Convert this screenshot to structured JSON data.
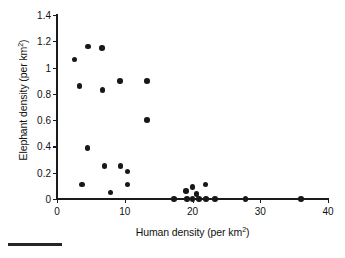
{
  "chart_data": {
    "type": "scatter",
    "title": "",
    "xlabel": "Human density (per km",
    "xlabel_sup": "2",
    "xlabel_tail": ")",
    "ylabel": "Elephant density (per km",
    "ylabel_sup": "2",
    "ylabel_tail": ")",
    "xlim": [
      0,
      40
    ],
    "ylim": [
      0,
      1.4
    ],
    "grid": false,
    "legend": "none",
    "marker": "filled-circle",
    "marker_color": "#181818",
    "xticks": [
      0,
      10,
      20,
      30,
      40
    ],
    "xtick_labels": [
      "0",
      "10",
      "20",
      "30",
      "40"
    ],
    "yticks": [
      0,
      0.2,
      0.4,
      0.6,
      0.8,
      1,
      1.2,
      1.4
    ],
    "ytick_labels": [
      "0",
      "0.2",
      "0.4",
      "0.6",
      "0.8",
      "1",
      "1.2",
      "1.4"
    ],
    "points": [
      {
        "x": 2.6,
        "y": 1.06
      },
      {
        "x": 3.3,
        "y": 0.86
      },
      {
        "x": 4.6,
        "y": 1.16
      },
      {
        "x": 6.6,
        "y": 1.15
      },
      {
        "x": 6.7,
        "y": 0.83
      },
      {
        "x": 9.3,
        "y": 0.9
      },
      {
        "x": 13.3,
        "y": 0.9
      },
      {
        "x": 13.3,
        "y": 0.6
      },
      {
        "x": 4.5,
        "y": 0.39
      },
      {
        "x": 7.0,
        "y": 0.25
      },
      {
        "x": 9.4,
        "y": 0.25
      },
      {
        "x": 10.4,
        "y": 0.21
      },
      {
        "x": 3.7,
        "y": 0.11
      },
      {
        "x": 10.4,
        "y": 0.11
      },
      {
        "x": 7.9,
        "y": 0.05
      },
      {
        "x": 17.3,
        "y": 0.0
      },
      {
        "x": 19.0,
        "y": 0.06
      },
      {
        "x": 19.2,
        "y": 0.0
      },
      {
        "x": 20.0,
        "y": 0.09
      },
      {
        "x": 20.0,
        "y": 0.0
      },
      {
        "x": 20.6,
        "y": 0.04
      },
      {
        "x": 21.0,
        "y": 0.0
      },
      {
        "x": 21.9,
        "y": 0.11
      },
      {
        "x": 22.0,
        "y": 0.0
      },
      {
        "x": 23.3,
        "y": 0.0
      },
      {
        "x": 27.8,
        "y": 0.0
      },
      {
        "x": 36.0,
        "y": 0.0
      }
    ]
  },
  "figure": {
    "scalebar_name": "bottom-rule"
  }
}
